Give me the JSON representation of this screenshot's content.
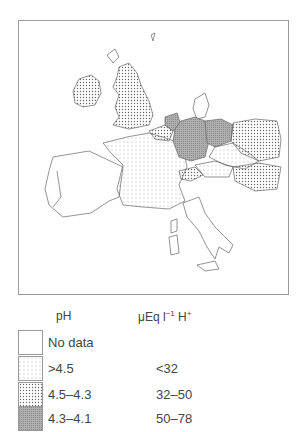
{
  "map": {
    "regions": [
      {
        "name": "Ireland",
        "class": "4.5-4.3"
      },
      {
        "name": "Great Britain",
        "class": "4.5-4.3"
      },
      {
        "name": "France",
        "class": ">4.5"
      },
      {
        "name": "Belgium",
        "class": "4.5-4.3"
      },
      {
        "name": "Netherlands",
        "class": "4.3-4.1"
      },
      {
        "name": "West Germany",
        "class": "4.3-4.1"
      },
      {
        "name": "East Germany",
        "class": "4.3-4.1"
      },
      {
        "name": "Poland",
        "class": "4.5-4.3"
      },
      {
        "name": "Czechoslovakia",
        "class": ">4.5"
      },
      {
        "name": "Switzerland",
        "class": "4.5-4.3"
      },
      {
        "name": "Austria",
        "class": ">4.5"
      },
      {
        "name": "Hungary",
        "class": "4.5-4.3"
      },
      {
        "name": "Denmark",
        "class": "No data"
      },
      {
        "name": "Spain",
        "class": "No data"
      },
      {
        "name": "Portugal",
        "class": "No data"
      },
      {
        "name": "Italy",
        "class": "No data"
      }
    ]
  },
  "legend": {
    "ph_header": "pH",
    "ueq_header_prefix": "μEq l",
    "ueq_header_exp": "−1",
    "ueq_header_unit": " H",
    "ueq_header_sup": "+",
    "items": [
      {
        "ph": "No data",
        "ueq": "",
        "pattern": "none"
      },
      {
        "ph": ">4.5",
        "ueq": "<32",
        "pattern": "fine-dots"
      },
      {
        "ph": "4.5–4.3",
        "ueq": "32–50",
        "pattern": "dense-dots"
      },
      {
        "ph": "4.3–4.1",
        "ueq": "50–78",
        "pattern": "grey-hatch"
      }
    ],
    "colors": {
      "border": "#999999",
      "dark_fill": "#a8a8a8",
      "dot": "#666666"
    }
  }
}
